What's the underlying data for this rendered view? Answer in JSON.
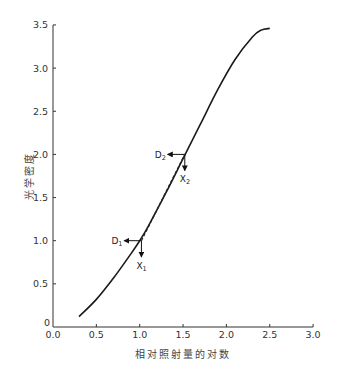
{
  "chart_data": {
    "type": "line",
    "title": "",
    "xlabel": "相对照射量的对数",
    "ylabel": "光学密度",
    "xlim": [
      0.0,
      3.0
    ],
    "ylim": [
      0,
      3.5
    ],
    "x_ticks": [
      "0.0",
      "0.5",
      "1.0",
      "1.5",
      "2.0",
      "2.5",
      "3.0"
    ],
    "y_ticks": [
      "0",
      "0.5",
      "1.0",
      "1.5",
      "2.0",
      "2.5",
      "3.0",
      "3.5"
    ],
    "grid": false,
    "legend": null,
    "series": [
      {
        "name": "characteristic curve",
        "x": [
          0.3,
          0.5,
          0.7,
          0.9,
          1.0,
          1.1,
          1.3,
          1.5,
          1.7,
          1.9,
          2.1,
          2.3,
          2.4,
          2.5
        ],
        "y": [
          0.12,
          0.32,
          0.57,
          0.85,
          1.0,
          1.17,
          1.55,
          1.95,
          2.35,
          2.75,
          3.1,
          3.36,
          3.44,
          3.46
        ]
      }
    ],
    "annotations": [
      {
        "label": "D",
        "subscript": "1",
        "x": 1.02,
        "y": 1.0,
        "arrow": "left",
        "note": "density at point 1"
      },
      {
        "label": "X",
        "subscript": "1",
        "x": 1.02,
        "y": 1.0,
        "arrow": "down",
        "note": "exposure at point 1"
      },
      {
        "label": "D",
        "subscript": "2",
        "x": 1.52,
        "y": 2.0,
        "arrow": "left",
        "note": "density at point 2"
      },
      {
        "label": "X",
        "subscript": "2",
        "x": 1.52,
        "y": 2.0,
        "arrow": "down",
        "note": "exposure at point 2"
      },
      {
        "type": "dashed-chord",
        "from": [
          1.02,
          1.0
        ],
        "to": [
          1.52,
          2.0
        ]
      }
    ]
  }
}
